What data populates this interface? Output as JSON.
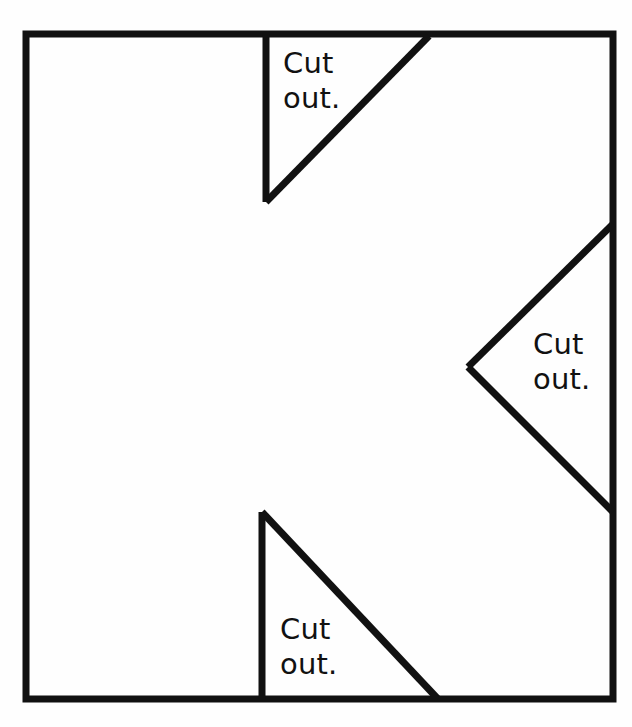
{
  "figure": {
    "background_color": "#fefefe",
    "stroke_color": "#111111",
    "stroke_width": 7,
    "canvas": {
      "width": 632,
      "height": 727
    },
    "outer_square": {
      "name": "outer-square",
      "left": 26,
      "top": 34,
      "right": 613,
      "bottom": 699
    },
    "cutouts": [
      {
        "id": "top",
        "position": "top-edge",
        "label_line1": "Cut",
        "label_line2": "out.",
        "points": "266,34 266,202 427,36",
        "vertices": [
          {
            "x": 266,
            "y": 34
          },
          {
            "x": 266,
            "y": 202
          },
          {
            "x": 427,
            "y": 36
          }
        ]
      },
      {
        "id": "right",
        "position": "right-edge",
        "label_line1": "Cut",
        "label_line2": "out.",
        "points": "611,225 470,367 611,512",
        "vertices": [
          {
            "x": 611,
            "y": 225
          },
          {
            "x": 470,
            "y": 367
          },
          {
            "x": 611,
            "y": 512
          }
        ]
      },
      {
        "id": "bottom",
        "position": "bottom-edge",
        "label_line1": "Cut",
        "label_line2": "out.",
        "points": "262,697 262,512 436,697",
        "vertices": [
          {
            "x": 262,
            "y": 697
          },
          {
            "x": 262,
            "y": 512
          },
          {
            "x": 436,
            "y": 697
          }
        ]
      }
    ]
  },
  "labels": {
    "top": {
      "line1": "Cut",
      "line2": "out."
    },
    "right": {
      "line1": "Cut",
      "line2": "out."
    },
    "bottom": {
      "line1": "Cut",
      "line2": "out."
    }
  }
}
